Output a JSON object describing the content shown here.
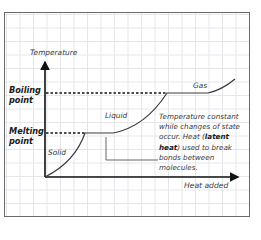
{
  "diagram": {
    "type": "heating-curve",
    "y_axis_label": "Temperature",
    "x_axis_label": "Heat added",
    "levels": {
      "boiling": "Boiling point",
      "melting": "Melting point"
    },
    "boiling_line_1": "Boiling",
    "boiling_line_2": "point",
    "melting_line_1": "Melting",
    "melting_line_2": "point",
    "phases": {
      "solid": "Solid",
      "liquid": "Liquid",
      "gas": "Gas"
    },
    "annotation": {
      "part1": "Temperature constant while changes of state occur. Heat (",
      "bold1": "latent heat",
      "part2": ") used to break bonds between molecules."
    },
    "colors": {
      "line": "#3c3c3c",
      "axis": "#111111",
      "grid": "#e4e6ea",
      "frame": "#6a6a6a"
    }
  }
}
